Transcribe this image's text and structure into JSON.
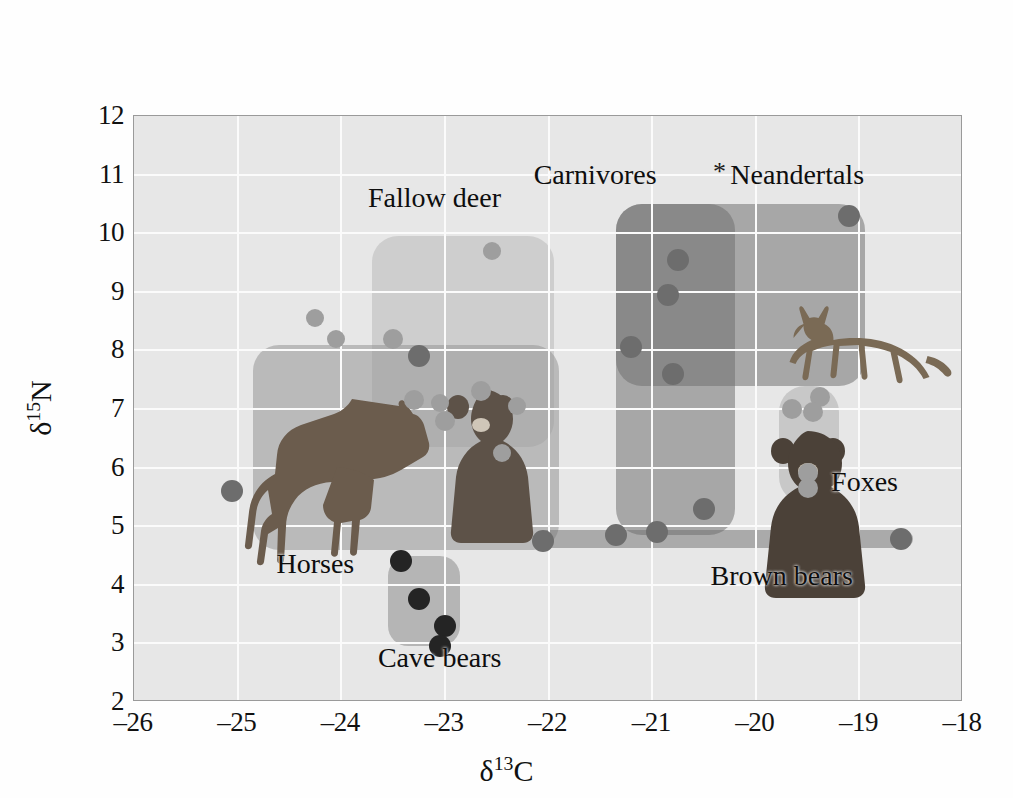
{
  "chart_data": {
    "type": "scatter",
    "title": "",
    "xlabel": "δ13C",
    "ylabel": "δ15N",
    "xlabel_parts": {
      "delta": "δ",
      "sup": "13",
      "element": "C"
    },
    "ylabel_parts": {
      "delta": "δ",
      "sup": "15",
      "element": "N"
    },
    "xlim": [
      -26,
      -18
    ],
    "ylim": [
      2,
      12
    ],
    "xticks": [
      "–26",
      "–25",
      "–24",
      "–23",
      "–22",
      "–21",
      "–20",
      "–19",
      "–18"
    ],
    "xtick_values": [
      -26,
      -25,
      -24,
      -23,
      -22,
      -21,
      -20,
      -19,
      -18
    ],
    "yticks": [
      "2",
      "3",
      "4",
      "5",
      "6",
      "7",
      "8",
      "9",
      "10",
      "11",
      "12"
    ],
    "ytick_values": [
      2,
      3,
      4,
      5,
      6,
      7,
      8,
      9,
      10,
      11,
      12
    ],
    "grid": true,
    "legend": "none",
    "background_color": "#e7e7e7",
    "gridline_color": "#fbfbfb",
    "groups": [
      {
        "name": "Fallow deer",
        "label": "Fallow deer",
        "label_x": -23.1,
        "label_y": 10.6,
        "region": {
          "x0": -23.7,
          "x1": -21.95,
          "y0": 6.35,
          "y1": 9.95
        },
        "region_style": "deer",
        "points": [
          {
            "x": -22.55,
            "y": 9.7,
            "tone": "light",
            "r": 9
          },
          {
            "x": -24.25,
            "y": 8.55,
            "tone": "light",
            "r": 9
          },
          {
            "x": -24.05,
            "y": 8.2,
            "tone": "light",
            "r": 9
          }
        ]
      },
      {
        "name": "Horses",
        "label": "Horses",
        "label_x": -24.25,
        "label_y": 4.35,
        "region": {
          "x0": -24.85,
          "x1": -21.9,
          "y0": 4.6,
          "y1": 8.1
        },
        "region_style": "horse",
        "points": [
          {
            "x": -23.5,
            "y": 8.2,
            "tone": "light",
            "r": 10
          },
          {
            "x": -23.25,
            "y": 7.9,
            "tone": "dark",
            "r": 11
          },
          {
            "x": -23.3,
            "y": 7.15,
            "tone": "light",
            "r": 10
          },
          {
            "x": -23.05,
            "y": 7.1,
            "tone": "light",
            "r": 9
          },
          {
            "x": -22.65,
            "y": 7.3,
            "tone": "light",
            "r": 10
          },
          {
            "x": -22.3,
            "y": 7.05,
            "tone": "light",
            "r": 9
          },
          {
            "x": -23.0,
            "y": 6.8,
            "tone": "light",
            "r": 10
          },
          {
            "x": -22.45,
            "y": 6.25,
            "tone": "light",
            "r": 9
          },
          {
            "x": -25.05,
            "y": 5.6,
            "tone": "dark",
            "r": 11
          }
        ]
      },
      {
        "name": "Carnivores",
        "label": "Carnivores",
        "label_x": -21.55,
        "label_y": 11.0,
        "region": {
          "x0": -21.35,
          "x1": -20.2,
          "y0": 4.85,
          "y1": 10.5
        },
        "region_style": "carniv",
        "points": [
          {
            "x": -20.75,
            "y": 9.55,
            "tone": "dark",
            "r": 11
          },
          {
            "x": -20.85,
            "y": 8.95,
            "tone": "dark",
            "r": 11
          },
          {
            "x": -21.2,
            "y": 8.05,
            "tone": "dark",
            "r": 11
          },
          {
            "x": -20.8,
            "y": 7.6,
            "tone": "dark",
            "r": 11
          },
          {
            "x": -20.5,
            "y": 5.3,
            "tone": "dark",
            "r": 11
          },
          {
            "x": -20.95,
            "y": 4.9,
            "tone": "dark",
            "r": 11
          }
        ]
      },
      {
        "name": "Neandertals",
        "label": "Neandertals",
        "label_x": -19.6,
        "label_y": 11.0,
        "region": {
          "x0": -21.35,
          "x1": -18.95,
          "y0": 7.4,
          "y1": 10.5
        },
        "region_style": "neander",
        "points": [
          {
            "x": -19.1,
            "y": 10.3,
            "tone": "dark",
            "r": 11
          }
        ],
        "marker": {
          "symbol": "*",
          "x": -20.35,
          "y": 11.05,
          "name": "asterisk-marker"
        }
      },
      {
        "name": "Foxes",
        "label": "Foxes",
        "label_x": -18.95,
        "label_y": 5.75,
        "region": {
          "x0": -19.78,
          "x1": -19.2,
          "y0": 5.4,
          "y1": 7.4
        },
        "region_style": "fox",
        "points": [
          {
            "x": -19.38,
            "y": 7.2,
            "tone": "light",
            "r": 10
          },
          {
            "x": -19.65,
            "y": 7.0,
            "tone": "light",
            "r": 10
          },
          {
            "x": -19.45,
            "y": 6.95,
            "tone": "light",
            "r": 10
          },
          {
            "x": -19.5,
            "y": 5.9,
            "tone": "light",
            "r": 10
          },
          {
            "x": -19.5,
            "y": 5.65,
            "tone": "light",
            "r": 10
          }
        ]
      },
      {
        "name": "Brown bears",
        "label": "Brown bears",
        "label_x": -19.75,
        "label_y": 4.15,
        "region": {
          "x0": -22.1,
          "x1": -18.48,
          "y0": 4.62,
          "y1": 4.94
        },
        "region_style": "brown",
        "points": [
          {
            "x": -22.05,
            "y": 4.75,
            "tone": "dark",
            "r": 11
          },
          {
            "x": -21.35,
            "y": 4.85,
            "tone": "dark",
            "r": 11
          },
          {
            "x": -18.6,
            "y": 4.78,
            "tone": "dark",
            "r": 11
          }
        ]
      },
      {
        "name": "Cave bears",
        "label": "Cave bears",
        "label_x": -23.05,
        "label_y": 2.75,
        "region": {
          "x0": -23.55,
          "x1": -22.85,
          "y0": 2.95,
          "y1": 4.5
        },
        "region_style": "cave",
        "points": [
          {
            "x": -23.42,
            "y": 4.4,
            "tone": "black",
            "r": 11
          },
          {
            "x": -23.25,
            "y": 3.75,
            "tone": "black",
            "r": 11
          },
          {
            "x": -23.0,
            "y": 3.3,
            "tone": "black",
            "r": 11
          },
          {
            "x": -23.05,
            "y": 2.95,
            "tone": "black",
            "r": 11
          }
        ]
      }
    ],
    "artwork": [
      {
        "name": "fallow-deer-image",
        "x": -23.1,
        "y": 12.0,
        "w": 170,
        "h": 135
      },
      {
        "name": "carnivore-cat-image",
        "x": -21.45,
        "y": 12.0,
        "w": 160,
        "h": 110
      },
      {
        "name": "neandertal-human-image",
        "x": -20.0,
        "y": 12.2,
        "w": 95,
        "h": 160
      },
      {
        "name": "fox-image",
        "x": -18.95,
        "y": 7.0,
        "w": 175,
        "h": 105
      },
      {
        "name": "horse-image",
        "x": -23.95,
        "y": 4.25,
        "w": 210,
        "h": 180
      },
      {
        "name": "cave-bear-image",
        "x": -22.6,
        "y": 4.3,
        "w": 150,
        "h": 190
      },
      {
        "name": "brown-bear-image",
        "x": -19.45,
        "y": 3.45,
        "w": 160,
        "h": 200
      }
    ]
  }
}
